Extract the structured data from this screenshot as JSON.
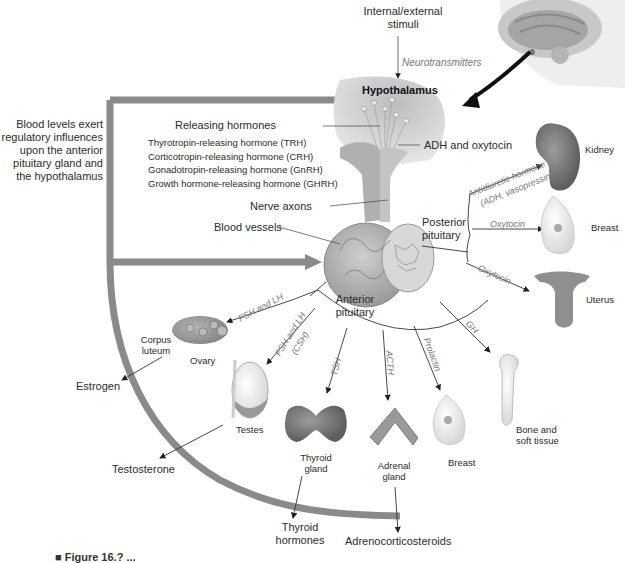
{
  "diagram": {
    "type": "endocrine-pathway",
    "colors": {
      "feedback_bar": "#8a8a8a",
      "feedback_bar_dark": "#6f6f6f",
      "gland_fill": "#b9b9b9",
      "hypothalamus_fill": "#a8a8a8",
      "kidney_fill": "#2e2e2e",
      "line": "#333333",
      "italic_label": "#777777"
    },
    "top": {
      "stimuli": "Internal/external stimuli",
      "stimuli_line1": "Internal/external",
      "stimuli_line2": "stimuli",
      "neurotransmitters": "Neurotransmitters",
      "hypothalamus": "Hypothalamus"
    },
    "feedback": {
      "line1": "Blood levels exert",
      "line2": "regulatory influences",
      "line3": "upon the anterior",
      "line4": "pituitary gland and",
      "line5": "the hypothalamus"
    },
    "releasing": {
      "heading": "Releasing hormones",
      "items": [
        "Thyrotropin-releasing hormone (TRH)",
        "Corticotropin-releasing hormone (CRH)",
        "Gonadotropin-releasing hormone (GnRH)",
        "Growth hormone-releasing hormone (GHRH)"
      ]
    },
    "structures": {
      "adh_oxytocin": "ADH and oxytocin",
      "nerve_axons": "Nerve axons",
      "blood_vessels": "Blood vessels",
      "posterior_line1": "Posterior",
      "posterior_line2": "pituitary",
      "anterior_line1": "Anterior",
      "anterior_line2": "pituitary"
    },
    "posterior_targets": [
      {
        "hormone_line1": "Antidiuretic hormone",
        "hormone_line2": "(ADH, vasopressin)",
        "target": "Kidney"
      },
      {
        "hormone": "Oxytocin",
        "target": "Breast"
      },
      {
        "hormone": "Oxytocin",
        "target": "Uterus"
      }
    ],
    "anterior_targets": [
      {
        "hormone": "FSH and LH",
        "target": "Ovary",
        "sub_label_line1": "Corpus",
        "sub_label_line2": "luteum",
        "product": "Estrogen"
      },
      {
        "hormone_line1": "FSH and LH",
        "hormone_line2": "(CSH)",
        "target": "Testes",
        "product": "Testosterone"
      },
      {
        "hormone": "TSH",
        "target_line1": "Thyroid",
        "target_line2": "gland",
        "product_line1": "Thyroid",
        "product_line2": "hormones"
      },
      {
        "hormone": "ACTH",
        "target_line1": "Adrenal",
        "target_line2": "gland",
        "product": "Adrenocorticosteroids"
      },
      {
        "hormone": "Prolactin",
        "target": "Breast"
      },
      {
        "hormone": "GH",
        "target_line1": "Bone and",
        "target_line2": "soft tissue"
      }
    ],
    "caption_partial": "■ Figure 16.?  ..."
  }
}
